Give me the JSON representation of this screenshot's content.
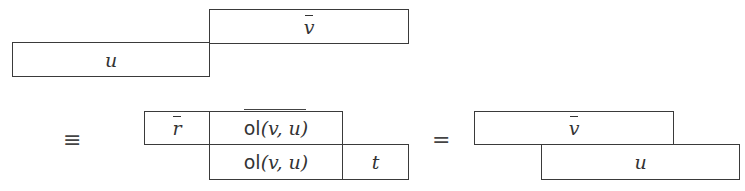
{
  "diagram": {
    "top_row": {
      "left_box": {
        "label": "u"
      },
      "right_box": {
        "label": "v",
        "overline": true
      }
    },
    "relations": {
      "equiv": "≡",
      "equals": "="
    },
    "middle": {
      "upper_left_box": {
        "label": "r",
        "overline": true
      },
      "upper_mid_box": {
        "func": "ol",
        "args": "(v, u)",
        "overline": true
      },
      "lower_mid_box": {
        "func": "ol",
        "args": "(v, u)"
      },
      "lower_right_box": {
        "label": "t"
      }
    },
    "right": {
      "upper_box": {
        "label": "v",
        "overline": true
      },
      "lower_box": {
        "label": "u"
      }
    }
  }
}
